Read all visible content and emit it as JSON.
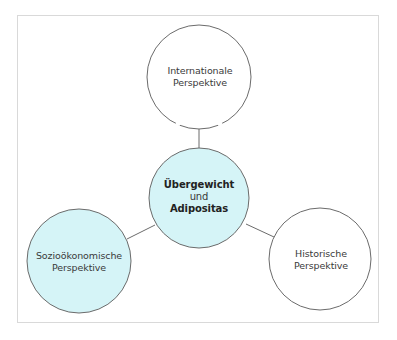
{
  "diagram": {
    "type": "concept-map",
    "colors": {
      "frame_border": "#d9d9d9",
      "circle_stroke": "#6b6b6b",
      "highlight_fill": "#d5f4f7",
      "plain_fill": "#ffffff",
      "connector": "#6b6b6b",
      "text": "#3a3a3a"
    },
    "center": {
      "line1": "Übergewicht",
      "line2": "und",
      "line3": "Adipositas",
      "fill": "#d5f4f7"
    },
    "nodes": [
      {
        "id": "international",
        "line1": "Internationale",
        "line2": "Perspektive",
        "fill": "#ffffff",
        "position": "top"
      },
      {
        "id": "soziooekonomisch",
        "line1": "Sozioökonomische",
        "line2": "Perspektive",
        "fill": "#d5f4f7",
        "position": "bottom-left"
      },
      {
        "id": "historisch",
        "line1": "Historische",
        "line2": "Perspektive",
        "fill": "#ffffff",
        "position": "bottom-right"
      }
    ],
    "edges": [
      {
        "from": "center",
        "to": "international"
      },
      {
        "from": "center",
        "to": "soziooekonomisch"
      },
      {
        "from": "center",
        "to": "historisch"
      }
    ]
  }
}
